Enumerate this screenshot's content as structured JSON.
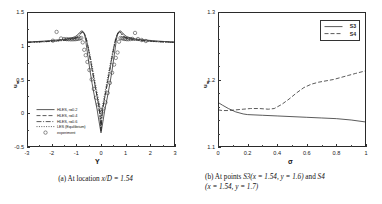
{
  "figure": {
    "panels": [
      {
        "id": "panel-a",
        "caption_prefix": "(a)",
        "caption_text": "At location",
        "caption_math": "x/D = 1.54",
        "axes": {
          "xlabel": "Y",
          "ylabel": "u",
          "ylabel_sub": "m",
          "xticks": [
            "-3",
            "-2",
            "-1",
            "0",
            "1",
            "2",
            "3"
          ],
          "yticks": [
            "-0.5",
            "0",
            "0.5",
            "1",
            "1.5"
          ],
          "xlim": [
            -3,
            3
          ],
          "ylim": [
            -0.5,
            1.5
          ]
        },
        "legend": [
          {
            "label": "HLES, r=0.2",
            "style": "solid"
          },
          {
            "label": "HLES, r=0.4",
            "style": "dashed"
          },
          {
            "label": "HLES, r=0.6",
            "style": "dashdot"
          },
          {
            "label": "LES (Equilibrium)",
            "style": "dotted"
          },
          {
            "label": "experiment",
            "style": "circle"
          }
        ]
      },
      {
        "id": "panel-b",
        "caption_prefix": "(b)",
        "caption_line1_a": "At points",
        "caption_line1_s3": "S3",
        "caption_line1_m1": "(x = 1.54, y = 1.6)",
        "caption_line1_and": "and",
        "caption_line1_s4": "S4",
        "caption_line2": "(x = 1.54, y = 1.7)",
        "axes": {
          "xlabel": "σ",
          "ylabel": "u",
          "ylabel_sub": "m",
          "xticks": [
            "0",
            "0.2",
            "0.4",
            "0.6",
            "0.8",
            "1"
          ],
          "yticks": [
            "1.1",
            "1.2",
            "1.3"
          ],
          "xlim": [
            0,
            1
          ],
          "ylim": [
            1.1,
            1.3
          ]
        },
        "legend": [
          {
            "label": "S3",
            "style": "solid"
          },
          {
            "label": "S4",
            "style": "dashed"
          }
        ]
      }
    ]
  },
  "chart_data": [
    {
      "type": "line",
      "id": "wake-velocity-profile",
      "title": "",
      "xlabel": "Y",
      "ylabel": "u_m",
      "xlim": [
        -3,
        3
      ],
      "ylim": [
        -0.5,
        1.5
      ],
      "xticks": [
        -3,
        -2,
        -1,
        0,
        1,
        2,
        3
      ],
      "yticks": [
        -0.5,
        0,
        0.5,
        1,
        1.5
      ],
      "grid": false,
      "legend_position": "lower-left",
      "series": [
        {
          "name": "HLES, r=0.2",
          "style": "solid",
          "x": [
            -3.0,
            -2.6,
            -2.2,
            -1.9,
            -1.6,
            -1.4,
            -1.2,
            -1.05,
            -0.95,
            -0.88,
            -0.82,
            -0.78,
            -0.74,
            -0.7,
            -0.66,
            -0.62,
            -0.58,
            -0.52,
            -0.45,
            -0.36,
            -0.26,
            -0.16,
            -0.08,
            0.0,
            0.08,
            0.16,
            0.26,
            0.36,
            0.45,
            0.52,
            0.58,
            0.62,
            0.66,
            0.7,
            0.74,
            0.78,
            0.82,
            0.88,
            0.95,
            1.05,
            1.2,
            1.4,
            1.6,
            1.9,
            2.2,
            2.6,
            3.0
          ],
          "y": [
            1.055,
            1.062,
            1.072,
            1.082,
            1.092,
            1.102,
            1.115,
            1.135,
            1.16,
            1.19,
            1.212,
            1.22,
            1.215,
            1.195,
            1.15,
            1.08,
            0.97,
            0.82,
            0.64,
            0.44,
            0.24,
            0.06,
            -0.12,
            -0.29,
            -0.12,
            0.06,
            0.24,
            0.44,
            0.64,
            0.82,
            0.97,
            1.08,
            1.15,
            1.195,
            1.215,
            1.22,
            1.212,
            1.19,
            1.16,
            1.135,
            1.115,
            1.102,
            1.092,
            1.082,
            1.072,
            1.062,
            1.055
          ]
        },
        {
          "name": "HLES, r=0.4",
          "style": "dashed",
          "x": [
            -3.0,
            -2.5,
            -2.0,
            -1.7,
            -1.45,
            -1.25,
            -1.1,
            -1.0,
            -0.92,
            -0.85,
            -0.8,
            -0.76,
            -0.72,
            -0.68,
            -0.63,
            -0.57,
            -0.5,
            -0.42,
            -0.33,
            -0.23,
            -0.13,
            -0.05,
            0.0,
            0.05,
            0.13,
            0.23,
            0.33,
            0.42,
            0.5,
            0.57,
            0.63,
            0.68,
            0.72,
            0.76,
            0.8,
            0.85,
            0.92,
            1.0,
            1.1,
            1.25,
            1.45,
            1.7,
            2.0,
            2.5,
            3.0
          ],
          "y": [
            1.052,
            1.06,
            1.07,
            1.08,
            1.09,
            1.1,
            1.112,
            1.128,
            1.15,
            1.178,
            1.2,
            1.21,
            1.205,
            1.185,
            1.14,
            1.055,
            0.93,
            0.775,
            0.59,
            0.39,
            0.19,
            0.01,
            -0.23,
            0.01,
            0.19,
            0.39,
            0.59,
            0.775,
            0.93,
            1.055,
            1.14,
            1.185,
            1.205,
            1.21,
            1.2,
            1.178,
            1.15,
            1.128,
            1.112,
            1.1,
            1.09,
            1.08,
            1.07,
            1.06,
            1.052
          ]
        },
        {
          "name": "HLES, r=0.6",
          "style": "dashdot",
          "x": [
            -3.0,
            -2.4,
            -1.9,
            -1.55,
            -1.3,
            -1.12,
            -1.0,
            -0.9,
            -0.84,
            -0.79,
            -0.75,
            -0.71,
            -0.66,
            -0.6,
            -0.53,
            -0.45,
            -0.36,
            -0.26,
            -0.16,
            -0.07,
            0.0,
            0.07,
            0.16,
            0.26,
            0.36,
            0.45,
            0.53,
            0.6,
            0.66,
            0.71,
            0.75,
            0.79,
            0.84,
            0.9,
            1.0,
            1.12,
            1.3,
            1.55,
            1.9,
            2.4,
            3.0
          ],
          "y": [
            1.05,
            1.058,
            1.068,
            1.078,
            1.088,
            1.1,
            1.118,
            1.145,
            1.172,
            1.195,
            1.205,
            1.198,
            1.17,
            1.105,
            0.99,
            0.83,
            0.645,
            0.445,
            0.25,
            0.075,
            -0.26,
            0.075,
            0.25,
            0.445,
            0.645,
            0.83,
            0.99,
            1.105,
            1.17,
            1.198,
            1.205,
            1.195,
            1.172,
            1.145,
            1.118,
            1.1,
            1.088,
            1.078,
            1.068,
            1.058,
            1.05
          ]
        },
        {
          "name": "LES (Equilibrium)",
          "style": "dotted",
          "x": [
            -3.0,
            -2.4,
            -1.9,
            -1.55,
            -1.3,
            -1.12,
            -1.0,
            -0.9,
            -0.83,
            -0.78,
            -0.74,
            -0.7,
            -0.65,
            -0.58,
            -0.5,
            -0.41,
            -0.31,
            -0.21,
            -0.11,
            -0.03,
            0.0,
            0.03,
            0.11,
            0.21,
            0.31,
            0.41,
            0.5,
            0.58,
            0.65,
            0.7,
            0.74,
            0.78,
            0.83,
            0.9,
            1.0,
            1.12,
            1.3,
            1.55,
            1.9,
            2.4,
            3.0
          ],
          "y": [
            1.048,
            1.056,
            1.066,
            1.076,
            1.086,
            1.098,
            1.115,
            1.14,
            1.168,
            1.19,
            1.198,
            1.188,
            1.158,
            1.09,
            0.96,
            0.8,
            0.61,
            0.41,
            0.215,
            0.045,
            -0.25,
            0.045,
            0.215,
            0.41,
            0.61,
            0.8,
            0.96,
            1.09,
            1.158,
            1.188,
            1.198,
            1.19,
            1.168,
            1.14,
            1.115,
            1.098,
            1.086,
            1.076,
            1.066,
            1.056,
            1.048
          ]
        },
        {
          "name": "experiment",
          "style": "circle",
          "x": [
            -1.95,
            -1.8,
            -1.62,
            -1.5,
            -1.4,
            -1.32,
            -1.24,
            -1.17,
            -1.1,
            -1.04,
            -0.98,
            -0.92,
            -0.86,
            -0.8,
            -0.74,
            -0.68,
            -0.62,
            -0.55,
            -0.47,
            -0.38,
            -0.29,
            -0.2,
            -0.12,
            -0.05,
            0.02,
            0.1,
            0.18,
            0.27,
            0.36,
            0.45,
            0.53,
            0.6,
            0.67,
            0.73,
            0.79,
            0.85,
            0.91,
            0.97,
            1.03,
            1.1,
            1.18,
            1.27,
            1.38,
            1.5,
            1.65,
            1.82
          ],
          "y": [
            1.075,
            1.205,
            1.108,
            1.1,
            1.098,
            1.096,
            1.095,
            1.095,
            1.096,
            1.098,
            1.1,
            1.103,
            1.108,
            1.115,
            1.05,
            0.94,
            0.86,
            0.76,
            0.64,
            0.5,
            0.36,
            0.23,
            0.13,
            0.055,
            0.01,
            0.07,
            0.16,
            0.3,
            0.45,
            0.6,
            0.72,
            0.82,
            0.9,
            1.06,
            1.115,
            1.11,
            1.105,
            1.1,
            1.098,
            1.096,
            1.098,
            1.102,
            1.19,
            1.1,
            1.085,
            1.07
          ]
        }
      ]
    },
    {
      "type": "line",
      "id": "sigma-sensitivity",
      "title": "",
      "xlabel": "σ",
      "ylabel": "u_m",
      "xlim": [
        0,
        1
      ],
      "ylim": [
        1.1,
        1.3
      ],
      "xticks": [
        0,
        0.2,
        0.4,
        0.6,
        0.8,
        1
      ],
      "yticks": [
        1.1,
        1.2,
        1.3
      ],
      "grid": false,
      "legend_position": "upper-right",
      "series": [
        {
          "name": "S3",
          "style": "solid",
          "x": [
            0.0,
            0.03,
            0.07,
            0.12,
            0.17,
            0.2,
            0.3,
            0.4,
            0.5,
            0.6,
            0.7,
            0.8,
            0.9,
            1.0
          ],
          "y": [
            1.166,
            1.162,
            1.157,
            1.152,
            1.149,
            1.148,
            1.147,
            1.146,
            1.145,
            1.144,
            1.143,
            1.142,
            1.14,
            1.137
          ]
        },
        {
          "name": "S4",
          "style": "dashed",
          "x": [
            0.0,
            0.03,
            0.07,
            0.12,
            0.17,
            0.22,
            0.28,
            0.34,
            0.38,
            0.43,
            0.48,
            0.53,
            0.58,
            0.63,
            0.68,
            0.73,
            0.78,
            0.83,
            0.88,
            0.93,
            1.0
          ],
          "y": [
            1.155,
            1.154,
            1.154,
            1.155,
            1.156,
            1.157,
            1.157,
            1.156,
            1.157,
            1.163,
            1.171,
            1.18,
            1.188,
            1.193,
            1.196,
            1.198,
            1.2,
            1.203,
            1.206,
            1.209,
            1.213
          ]
        }
      ]
    }
  ]
}
